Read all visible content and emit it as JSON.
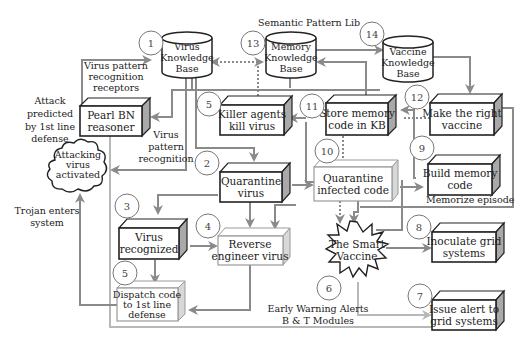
{
  "diagram": {
    "title": "Semantic Pattern Lib",
    "knowledge_bases": [
      {
        "id": "virus-kb",
        "badge": "1",
        "lines": [
          "Virus",
          "Knowledge",
          "Base"
        ]
      },
      {
        "id": "memory-kb",
        "badge": "13",
        "lines": [
          "Memory",
          "Knowledge",
          "Base"
        ]
      },
      {
        "id": "vaccine-kb",
        "badge": "14",
        "lines": [
          "Vaccine",
          "Knowledge",
          "Base"
        ]
      }
    ],
    "nodes": [
      {
        "id": "pearl-bn",
        "lines": [
          "Pearl BN",
          "reasoner"
        ]
      },
      {
        "id": "killer-agents",
        "badge": "5",
        "lines": [
          "Killer agents",
          "kill virus"
        ]
      },
      {
        "id": "store-memory",
        "badge": "11",
        "lines": [
          "Store memory",
          "code in KB"
        ]
      },
      {
        "id": "make-vaccine",
        "badge": "12",
        "lines": [
          "Make the right",
          "vaccine"
        ]
      },
      {
        "id": "quarantine-virus",
        "badge": "2",
        "lines": [
          "Quarantine",
          "virus"
        ]
      },
      {
        "id": "quarantine-code",
        "badge": "10",
        "lines": [
          "Quarantine",
          "infected code"
        ]
      },
      {
        "id": "build-memory",
        "badge": "9",
        "lines": [
          "Build memory",
          "code"
        ]
      },
      {
        "id": "virus-recognized",
        "badge": "3",
        "lines": [
          "Virus",
          "recognized"
        ]
      },
      {
        "id": "reverse-engineer",
        "badge": "4",
        "lines": [
          "Reverse",
          "engineer virus"
        ]
      },
      {
        "id": "smart-vaccine",
        "lines": [
          "The Smart",
          "Vaccine"
        ]
      },
      {
        "id": "inoculate",
        "badge": "8",
        "lines": [
          "Inoculate grid",
          "systems"
        ]
      },
      {
        "id": "dispatch-code",
        "badge": "5",
        "lines": [
          "Dispatch code",
          "to 1st line",
          "defense"
        ]
      },
      {
        "id": "issue-alert",
        "badge": "7",
        "lines": [
          "Issue alert to",
          "grid systems"
        ]
      },
      {
        "id": "attacking-virus",
        "lines": [
          "Attacking",
          "virus",
          "activated"
        ]
      }
    ],
    "annotations": {
      "receptors": [
        "Virus pattern",
        "recognition",
        "receptors"
      ],
      "attack_predicted": [
        "Attack",
        "predicted",
        "by 1st line",
        "defense"
      ],
      "pattern_recognition": [
        "Virus",
        "pattern",
        "recognition"
      ],
      "trojan": [
        "Trojan enters",
        "system"
      ],
      "memorize": "Memorize episode",
      "early_warning": [
        "Early Warning Alerts",
        "B & T Modules"
      ],
      "badge6": "6"
    }
  }
}
